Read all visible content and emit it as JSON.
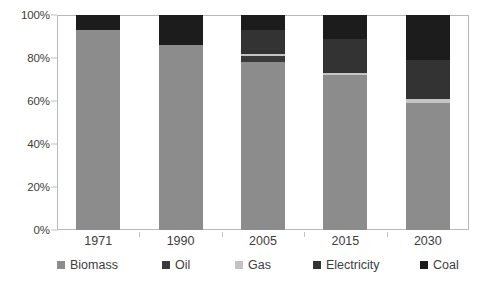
{
  "chart_data": {
    "type": "bar",
    "stacked": true,
    "stack_mode": "percent",
    "title": "",
    "subtitle": "",
    "xlabel": "",
    "ylabel": "",
    "categories": [
      "1971",
      "1990",
      "2005",
      "2015",
      "2030"
    ],
    "ytick_labels": [
      "0%",
      "20%",
      "40%",
      "60%",
      "80%",
      "100%"
    ],
    "ytick_values": [
      0,
      20,
      40,
      60,
      80,
      100
    ],
    "ylim": [
      0,
      100
    ],
    "grid": false,
    "legend_position": "bottom",
    "series": [
      {
        "name": "Biomass",
        "color": "#8c8c8c",
        "values": [
          93,
          86,
          78,
          72,
          59
        ]
      },
      {
        "name": "Oil",
        "color": "#3a3a3a",
        "values": [
          0,
          0,
          3,
          0,
          0
        ]
      },
      {
        "name": "Gas",
        "color": "#c4c4c4",
        "values": [
          0,
          0,
          1,
          1,
          2
        ]
      },
      {
        "name": "Electricity",
        "color": "#333333",
        "values": [
          0,
          0,
          11,
          16,
          18
        ]
      },
      {
        "name": "Coal",
        "color": "#1c1c1c",
        "values": [
          7,
          14,
          7,
          11,
          21
        ]
      }
    ]
  },
  "axis": {
    "frame_color": "#b9b9b9",
    "tick_color": "#c2c2c2",
    "text_color": "#3d3d3d"
  }
}
